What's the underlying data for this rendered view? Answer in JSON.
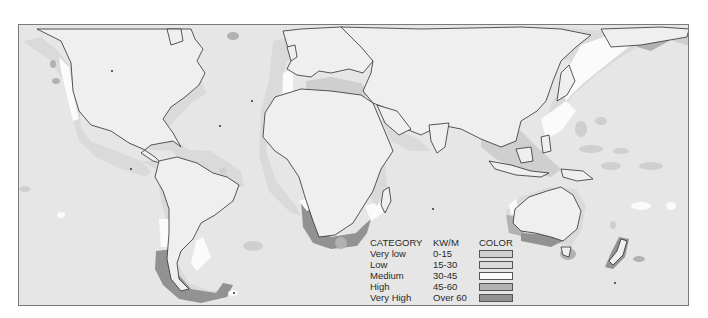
{
  "map": {
    "title": "Global wave power distribution",
    "colors": {
      "ocean": "#e6e6e6",
      "land": "#efefef",
      "coastline": "#2e2e2e",
      "frame": "#7a7a7a"
    }
  },
  "legend": {
    "headers": {
      "category": "CATEGORY",
      "unit": "KW/M",
      "color": "COLOR"
    },
    "items": [
      {
        "category": "Very low",
        "range": "0-15",
        "color": "#cfcfcf"
      },
      {
        "category": "Low",
        "range": "15-30",
        "color": "#dadada"
      },
      {
        "category": "Medium",
        "range": "30-45",
        "color": "#fbfbfb"
      },
      {
        "category": "High",
        "range": "45-60",
        "color": "#b2b2b2"
      },
      {
        "category": "Very High",
        "range": "Over 60",
        "color": "#929292"
      }
    ]
  }
}
